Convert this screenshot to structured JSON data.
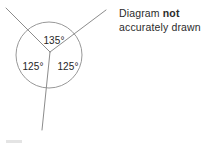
{
  "canvas": {
    "width": 213,
    "height": 146,
    "background": "#ffffff"
  },
  "note": {
    "line1_prefix": "Diagram ",
    "line1_emphasis": "not",
    "line2": "accurately drawn",
    "color": "#2b2b2b"
  },
  "diagram": {
    "type": "angles-around-a-point",
    "stroke_color": "#8c8c8c",
    "circle": {
      "center_x": 49,
      "center_y": 55,
      "radius": 33
    },
    "vertex": {
      "x": 50,
      "y": 52
    },
    "rays": [
      {
        "name": "upper-left-ray",
        "end_x": 6,
        "end_y": 8
      },
      {
        "name": "upper-right-ray",
        "end_x": 106,
        "end_y": 10
      },
      {
        "name": "lower-ray",
        "end_x": 42,
        "end_y": 130
      }
    ],
    "labels": {
      "top": "135°",
      "left": "125°",
      "right": "125°"
    },
    "angle_sum": "385°"
  }
}
